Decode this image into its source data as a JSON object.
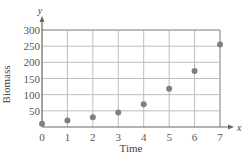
{
  "chart_data": {
    "type": "scatter",
    "title": "",
    "xlabel": "Time",
    "ylabel": "Biomass",
    "x_axis_var": "x",
    "y_axis_var": "y",
    "x": [
      0,
      1,
      2,
      3,
      4,
      5,
      6,
      7
    ],
    "values": [
      10,
      20,
      30,
      45,
      70,
      118,
      173,
      255
    ],
    "xlim": [
      0,
      7
    ],
    "ylim": [
      0,
      300
    ],
    "x_ticks": [
      "0",
      "1",
      "2",
      "3",
      "4",
      "5",
      "6",
      "7"
    ],
    "y_ticks": [
      "50",
      "100",
      "150",
      "200",
      "250",
      "300"
    ],
    "grid": true,
    "legend": null,
    "colors": {
      "points": "#808080",
      "grid": "#bdbdbd",
      "axis": "#666666"
    }
  }
}
